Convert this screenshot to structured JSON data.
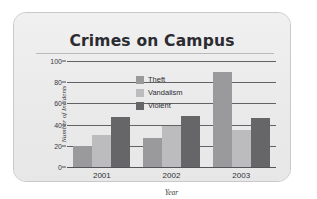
{
  "chart_data": {
    "type": "bar",
    "title": "Crimes on Campus",
    "xlabel": "Year",
    "ylabel": "Number of Incidents",
    "categories": [
      "2001",
      "2002",
      "2003"
    ],
    "series": [
      {
        "name": "Theft",
        "color": "#9a9a9c",
        "values": [
          20,
          27,
          90
        ]
      },
      {
        "name": "Vandalism",
        "color": "#bcbcbe",
        "values": [
          30,
          39,
          35
        ]
      },
      {
        "name": "Violent",
        "color": "#666669",
        "values": [
          47,
          48,
          46
        ]
      }
    ],
    "ylim": [
      0,
      100
    ],
    "yticks": [
      0,
      20,
      40,
      60,
      80,
      100
    ],
    "ytick_labels": [
      "0",
      "20",
      "40",
      "60",
      "80",
      "100"
    ],
    "grid": true,
    "legend_position": "upper-center"
  },
  "legend": {
    "items": [
      {
        "label": "Theft"
      },
      {
        "label": "Vandalism"
      },
      {
        "label": "Violent"
      }
    ]
  }
}
